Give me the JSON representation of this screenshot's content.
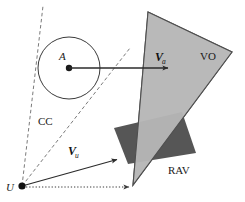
{
  "figure": {
    "background_color": "#ffffff",
    "width": 245,
    "height": 202
  },
  "colors": {
    "velocity_obstacle_fill": "#b9b9b9",
    "velocity_obstacle_stroke": "#4f4f4f",
    "reachable_avoidance_fill": "#565656",
    "stroke": "#2b2b2b",
    "dashed_stroke": "#6b6b6b",
    "dotted_stroke": "#3a3a3a",
    "label_color": "#1a1a1a"
  },
  "labels": {
    "obstacle_center": "A",
    "robot_origin": "U",
    "collision_cone": "CC",
    "velocity_obstacle": "VO",
    "reachable_avoidance_velocities": "RAV",
    "obstacle_velocity_symbol": "V",
    "obstacle_velocity_subscript": "a",
    "robot_velocity_symbol": "V",
    "robot_velocity_subscript": "u"
  },
  "geometry": {
    "obstacle_circle": {
      "cx": 69,
      "cy": 68,
      "r": 31
    },
    "obstacle_center_dot": {
      "cx": 69,
      "cy": 68,
      "r": 3.2
    },
    "robot_origin_dot": {
      "cx": 22,
      "cy": 186,
      "r": 3.6
    },
    "obstacle_velocity_arrow": {
      "x1": 69,
      "y1": 68,
      "x2": 170,
      "y2": 68
    },
    "robot_velocity_arrow": {
      "x1": 22,
      "y1": 186,
      "x2": 119,
      "y2": 159
    },
    "baseline_dotted_arrow": {
      "x1": 26,
      "y1": 187,
      "x2": 131,
      "y2": 187
    },
    "collision_cone_left_ray": {
      "x1": 22,
      "y1": 186,
      "x2": 43,
      "y2": 6
    },
    "collision_cone_right_ray": {
      "x1": 22,
      "y1": 186,
      "x2": 130,
      "y2": 48
    },
    "velocity_obstacle_polygon": "148,12 232,52 133,185",
    "reachable_avoidance_polygon": "114,128 182,112 196,153 128,164"
  },
  "label_positions": {
    "obstacle_center": {
      "x": 59,
      "y": 60
    },
    "robot_origin": {
      "x": 8,
      "y": 190
    },
    "collision_cone": {
      "x": 38,
      "y": 124
    },
    "velocity_obstacle": {
      "x": 201,
      "y": 59
    },
    "reachable_avoidance_velocities": {
      "x": 168,
      "y": 173
    },
    "obstacle_velocity": {
      "x": 155,
      "y": 62
    },
    "robot_velocity": {
      "x": 69,
      "y": 156
    }
  }
}
